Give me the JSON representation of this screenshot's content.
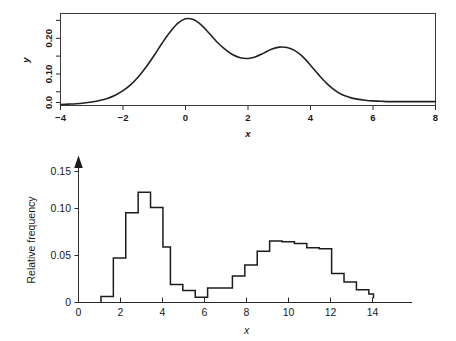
{
  "figure": {
    "background": "#ffffff",
    "ink_color": "#1c1c1c"
  },
  "chart_data": [
    {
      "id": "top-density",
      "type": "line",
      "title": "",
      "xlabel": "x",
      "ylabel": "y",
      "xlim": [
        -4,
        8
      ],
      "ylim": [
        0,
        0.26
      ],
      "grid": false,
      "legend": "none",
      "frame": "box",
      "xticks": [
        -4,
        -2,
        0,
        2,
        4,
        6,
        8
      ],
      "xticklabels": [
        "−4",
        "−2",
        "0",
        "2",
        "4",
        "6",
        "8"
      ],
      "yticks": [
        0.0,
        0.05,
        0.1,
        0.15,
        0.2,
        0.25
      ],
      "yticklabels_shown": [
        "0.0",
        "0.10",
        "0.20"
      ],
      "yticklabel_values": [
        0.0,
        0.1,
        0.2
      ],
      "description": "Bimodal probability density curve: tall mode near x=0 (y≈0.245) and smaller mode near x=3 (y≈0.165), trough near x=1.8 (y≈0.133)",
      "x": [
        -4.0,
        -3.75,
        -3.5,
        -3.25,
        -3.0,
        -2.75,
        -2.5,
        -2.25,
        -2.0,
        -1.75,
        -1.5,
        -1.25,
        -1.0,
        -0.75,
        -0.5,
        -0.25,
        0.0,
        0.25,
        0.5,
        0.75,
        1.0,
        1.25,
        1.5,
        1.75,
        2.0,
        2.25,
        2.5,
        2.75,
        3.0,
        3.25,
        3.5,
        3.75,
        4.0,
        4.25,
        4.5,
        4.75,
        5.0,
        5.25,
        5.5,
        5.75,
        6.0,
        6.25,
        6.5,
        6.75,
        7.0,
        7.25,
        7.5,
        7.75,
        8.0
      ],
      "y": [
        0.003,
        0.004,
        0.005,
        0.007,
        0.01,
        0.014,
        0.02,
        0.029,
        0.042,
        0.059,
        0.082,
        0.11,
        0.142,
        0.176,
        0.207,
        0.232,
        0.245,
        0.243,
        0.228,
        0.205,
        0.18,
        0.16,
        0.144,
        0.135,
        0.133,
        0.138,
        0.148,
        0.159,
        0.165,
        0.164,
        0.155,
        0.138,
        0.114,
        0.088,
        0.064,
        0.045,
        0.031,
        0.023,
        0.018,
        0.015,
        0.013,
        0.012,
        0.011,
        0.011,
        0.011,
        0.011,
        0.011,
        0.011,
        0.011
      ]
    },
    {
      "id": "bottom-histogram",
      "type": "bar",
      "title": "",
      "xlabel": "x",
      "ylabel": "Relative frequency",
      "xlim": [
        0,
        15.6
      ],
      "ylim": [
        0,
        0.162
      ],
      "grid": false,
      "legend": "none",
      "frame": "left-and-bottom-axes-with-y-arrow",
      "xticks": [
        0,
        2,
        4,
        6,
        8,
        10,
        12,
        14
      ],
      "xticklabels": [
        "0",
        "2",
        "4",
        "6",
        "8",
        "10",
        "12",
        "14"
      ],
      "yticks": [
        0,
        0.05,
        0.1,
        0.15
      ],
      "yticklabels": [
        "0",
        "0.05",
        "0.10",
        "0.15"
      ],
      "bin_width": 0.58,
      "bin_edges": [
        1.05,
        1.63,
        2.21,
        2.79,
        3.37,
        3.95,
        4.3,
        4.88,
        5.46,
        6.04,
        6.62,
        7.2,
        7.78,
        8.36,
        8.94,
        9.52,
        10.1,
        10.68,
        11.26,
        11.84,
        12.42,
        13.0,
        13.58,
        13.8
      ],
      "values": [
        0.007,
        0.052,
        0.105,
        0.129,
        0.111,
        0.065,
        0.021,
        0.014,
        0.006,
        0.017,
        0.017,
        0.031,
        0.044,
        0.06,
        0.072,
        0.071,
        0.069,
        0.064,
        0.063,
        0.034,
        0.024,
        0.015,
        0.01,
        0.005
      ],
      "description": "Bimodal relative-frequency histogram: first mode near x=3 (height ≈0.129), second broader mode near x=9 (height ≈0.072), trough near x=5.8 (≈0.006)"
    }
  ]
}
